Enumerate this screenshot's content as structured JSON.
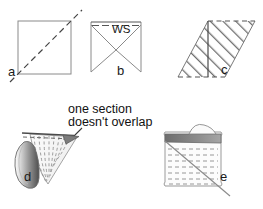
{
  "figure": {
    "background_color": "#ffffff",
    "line_color": "#6e6e6e",
    "dark_line_color": "#333333",
    "text_color": "#111111",
    "width": 263,
    "height": 209
  },
  "panels": [
    {
      "id": "a",
      "label": "a",
      "name": "square-with-bias-diagonal",
      "description": "square fabric piece with dashed bias diagonal line extending past the top-right corner",
      "label_x": 8,
      "label_y": 72,
      "shape": {
        "type": "square",
        "x": 18,
        "y": 21,
        "size": 53,
        "diagonal_style": "dashed",
        "diagonal_extends_beyond_corners": true
      }
    },
    {
      "id": "b",
      "label": "b",
      "name": "square-folded-to-point-wrong-side",
      "description": "square with two diagonals from top corners meeting at a lower centre point, dashed top edge, wrong-side marking",
      "label_x": 118,
      "label_y": 70,
      "annotation": "WS",
      "annotation_x": 118,
      "annotation_y": 27,
      "shape": {
        "type": "square",
        "x": 91,
        "y": 22,
        "size": 50,
        "top_edge_style": "dashed",
        "diagonals": "two-from-top-corners-to-apex"
      }
    },
    {
      "id": "c",
      "label": "c",
      "name": "hatched-parallelogram-bias-strip",
      "description": "parallelogram of bias fabric with diagonal hatch marks, dashed top and bottom edges and a vertical seam line",
      "label_x": 222,
      "label_y": 70,
      "shape": {
        "type": "parallelogram",
        "x": 159,
        "y": 21,
        "width": 74,
        "height": 56,
        "skew": 30,
        "hatch": "diagonal",
        "top_edge_style": "dashed",
        "bottom_edge_style": "dashed",
        "vertical_seam_line": true
      }
    },
    {
      "id": "d",
      "label": "d",
      "name": "rolled-cone-fan-no-overlap",
      "description": "fabric rolled into a cone/fan with curved dashed fold lines and a dark shaded rolled edge at left",
      "label_x": 25,
      "label_y": 177,
      "shape": {
        "type": "cone-fan-roll",
        "x": 18,
        "y": 132,
        "width": 72,
        "height": 58
      }
    },
    {
      "id": "e",
      "label": "e",
      "name": "tube-with-horizontal-dashes-and-diagonal",
      "description": "rounded fabric tube with dark shaded top band, horizontal dashed stitch lines and a diagonal cutting line",
      "label_x": 221,
      "label_y": 177,
      "shape": {
        "type": "rounded-tube",
        "x": 163,
        "y": 134,
        "width": 58,
        "height": 55,
        "dash_rows": 8,
        "diagonal_line": true,
        "top_band_shaded": true
      }
    }
  ],
  "annotations": [
    {
      "name": "no-overlap-callout",
      "line1": "one section",
      "line2": "doesn't overlap",
      "x": 68,
      "y": 104,
      "pointer": {
        "from_x": 80,
        "from_y": 126,
        "to_x": 70,
        "to_y": 140
      }
    }
  ]
}
